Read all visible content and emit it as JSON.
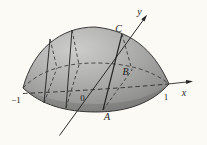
{
  "figure": {
    "labels": {
      "x_axis": "x",
      "y_axis": "y",
      "origin": "0",
      "tick_neg1": "−1",
      "tick_pos1": "1",
      "point_a": "A",
      "point_b": "B",
      "point_c": "C"
    },
    "colors": {
      "background": "#fbfaf5",
      "dome_light": "#cccccb",
      "dome_mid": "#b0b0ae",
      "dome_dark": "#828280",
      "line": "#222222"
    }
  }
}
